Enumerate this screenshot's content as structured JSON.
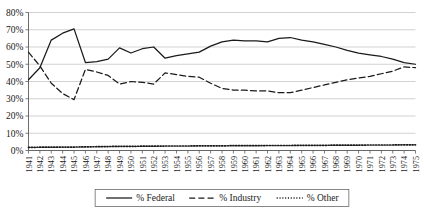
{
  "chart_data": {
    "type": "line",
    "title": "",
    "subtitle": "",
    "xlabel": "",
    "ylabel": "",
    "ylim": [
      0,
      80
    ],
    "ytick_labels": [
      "0%",
      "10%",
      "20%",
      "30%",
      "40%",
      "50%",
      "60%",
      "70%",
      "80%"
    ],
    "ytick_values": [
      0,
      10,
      20,
      30,
      40,
      50,
      60,
      70,
      80
    ],
    "grid": true,
    "legend_position": "bottom",
    "categories": [
      "1941",
      "1942",
      "1943",
      "1944",
      "1945",
      "1946",
      "1947",
      "1948",
      "1949",
      "1950",
      "1951",
      "1952",
      "1953",
      "1954",
      "1955",
      "1956",
      "1957",
      "1958",
      "1959",
      "1960",
      "1961",
      "1962",
      "1963",
      "1964",
      "1965",
      "1966",
      "1967",
      "1968",
      "1969",
      "1970",
      "1971",
      "1972",
      "1973",
      "1974",
      "1975"
    ],
    "series": [
      {
        "name": "% Federal",
        "style": "solid",
        "values": [
          41,
          48,
          64,
          68,
          70.5,
          51,
          51.5,
          53,
          59.5,
          56.5,
          59,
          60,
          53.5,
          55,
          56,
          57,
          60.5,
          63,
          64,
          63.5,
          63.5,
          63,
          65,
          65.5,
          64,
          63,
          61.5,
          60,
          58,
          56.5,
          55.5,
          54.5,
          53,
          51,
          50
        ]
      },
      {
        "name": "% Industry",
        "style": "dashed",
        "values": [
          57,
          49,
          39,
          33,
          29.5,
          47,
          45.5,
          43.5,
          38.5,
          40,
          39.5,
          38.5,
          45,
          44,
          43,
          42.5,
          39,
          36,
          35,
          35,
          34.5,
          34.5,
          33.5,
          33.5,
          35,
          36.5,
          38,
          39.5,
          41,
          42,
          43,
          44.5,
          46,
          48.5,
          48
        ]
      },
      {
        "name": "% Other",
        "style": "dotted",
        "values": [
          1.8,
          1.9,
          1.9,
          2,
          2,
          2.1,
          2.2,
          2.3,
          2.4,
          2.4,
          2.5,
          2.5,
          2.6,
          2.6,
          2.6,
          2.7,
          2.7,
          2.7,
          2.8,
          2.8,
          2.8,
          2.9,
          2.9,
          2.9,
          3,
          3,
          3,
          3.1,
          3.1,
          3.1,
          3.2,
          3.2,
          3.2,
          3.3,
          3.3
        ]
      }
    ]
  },
  "legend": {
    "items": [
      {
        "label": "% Federal",
        "style": "solid"
      },
      {
        "label": "% Industry",
        "style": "dashed"
      },
      {
        "label": "% Other",
        "style": "dotted"
      }
    ]
  },
  "colors": {
    "line": "#1a1a1a",
    "grid": "#bfbfbf",
    "axis": "#5a5a5a",
    "background": "#ffffff"
  }
}
